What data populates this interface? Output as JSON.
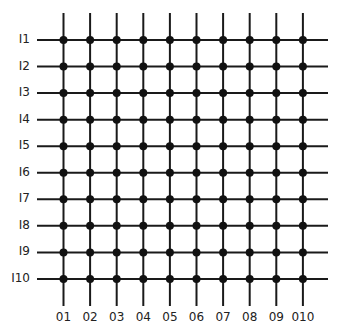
{
  "diagram": {
    "type": "crossbar-grid",
    "row_labels": [
      "I1",
      "I2",
      "I3",
      "I4",
      "I5",
      "I6",
      "I7",
      "I8",
      "I9",
      "I10"
    ],
    "col_labels": [
      "O1",
      "O2",
      "O3",
      "O4",
      "O5",
      "O6",
      "O7",
      "O8",
      "O9",
      "O10"
    ],
    "row_labels_display": [
      "I1",
      "I2",
      "I3",
      "I4",
      "I5",
      "I6",
      "I7",
      "I8",
      "I9",
      "I10"
    ],
    "col_labels_display": [
      "01",
      "02",
      "03",
      "04",
      "05",
      "06",
      "07",
      "08",
      "09",
      "010"
    ],
    "crosspoints": "all 100 intersections marked with a filled dot",
    "line_color": "#1a1a1a",
    "dot_color": "#111111"
  }
}
